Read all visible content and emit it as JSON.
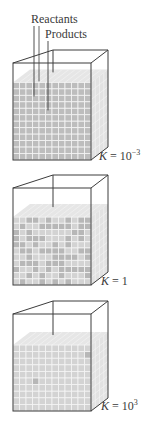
{
  "labels": {
    "reactants": "Reactants",
    "products": "Products"
  },
  "panels": [
    {
      "id": "k-small",
      "k_prefix": "K",
      "k_eq": " = 10",
      "k_exp": "−3",
      "top_y": 50,
      "fill_fraction": 0.8,
      "dark_pattern": "mostly-reactants"
    },
    {
      "id": "k-one",
      "k_prefix": "K",
      "k_eq": " = 1",
      "k_exp": "",
      "top_y": 175,
      "fill_fraction": 0.7,
      "dark_pattern": "mixed"
    },
    {
      "id": "k-large",
      "k_prefix": "K",
      "k_eq": " = 10",
      "k_exp": "3",
      "top_y": 301,
      "fill_fraction": 0.68,
      "dark_pattern": "mostly-products"
    }
  ],
  "colors": {
    "frame": "#3c3c3c",
    "reactant_cell": "#b7b7b7",
    "product_cell": "#d3d3d3",
    "grid_line": "#f4f4f4",
    "side_face": "#e2e2e2",
    "top_face": "#e6e6e6",
    "text": "#3a3a3a"
  }
}
